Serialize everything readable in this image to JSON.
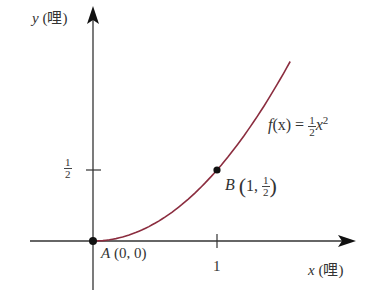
{
  "chart_data": {
    "type": "line",
    "title": "",
    "xlabel": "x (哩)",
    "ylabel": "y (哩)",
    "x_var": "x",
    "y_var": "y",
    "unit": "哩",
    "function": "f(x) = 1/2 x^2",
    "series": [
      {
        "name": "f(x) = ½x²",
        "color": "#8b2d3f",
        "x": [
          0,
          0.2,
          0.4,
          0.6,
          0.8,
          1.0,
          1.2,
          1.4,
          1.59
        ],
        "values": [
          0,
          0.02,
          0.08,
          0.18,
          0.32,
          0.5,
          0.72,
          0.98,
          1.26
        ]
      }
    ],
    "points": [
      {
        "name": "A",
        "label": "A (0, 0)",
        "x": 0,
        "y": 0
      },
      {
        "name": "B",
        "label": "B (1, 1/2)",
        "x": 1,
        "y": 0.5
      }
    ],
    "x_ticks": [
      {
        "value": 1,
        "label": "1"
      }
    ],
    "y_ticks": [
      {
        "value": 0.5,
        "label": "1/2"
      }
    ],
    "xlim": [
      -0.5,
      2.1
    ],
    "ylim": [
      -0.35,
      1.7
    ],
    "grid": false,
    "legend": "none"
  },
  "labels": {
    "y_axis_var": "y",
    "y_axis_unit": "(哩)",
    "x_axis_var": "x",
    "x_axis_unit": "(哩)",
    "y_tick_num": "1",
    "y_tick_den": "2",
    "x_tick": "1",
    "point_a_name": "A",
    "point_a_coords": "(0, 0)",
    "point_b_name": "B",
    "point_b_x": "1,",
    "point_b_num": "1",
    "point_b_den": "2",
    "func_name": "f",
    "func_arg": "(x) =",
    "func_num": "1",
    "func_den": "2",
    "func_var": "x",
    "func_exp": "2"
  },
  "colors": {
    "curve": "#8b2d3f",
    "axes": "#333333",
    "points": "#111111"
  }
}
